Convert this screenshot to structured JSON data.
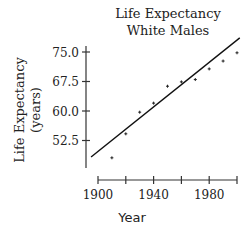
{
  "chart_data": {
    "type": "scatter",
    "title": "Life Expectancy",
    "subtitle": "White Males",
    "xlabel": "Year",
    "ylabel": "Life Expectancy",
    "ylabel_units": "(years)",
    "x_ticks": [
      1900,
      1920,
      1940,
      1960,
      1980,
      2000
    ],
    "x_tick_labels": [
      "1900",
      "",
      "1940",
      "",
      "1980",
      ""
    ],
    "y_ticks": [
      52.5,
      60.0,
      67.5,
      75.0
    ],
    "y_tick_labels": [
      "52.5",
      "60.0",
      "67.5",
      "75.0"
    ],
    "xlim": [
      1900,
      2000
    ],
    "ylim": [
      46,
      78
    ],
    "grid": false,
    "legend": null,
    "series": [
      {
        "name": "Observed",
        "x": [
          1910,
          1920,
          1930,
          1940,
          1950,
          1960,
          1970,
          1980,
          1990,
          2000
        ],
        "y": [
          48.1,
          54.2,
          59.7,
          62.0,
          66.3,
          67.4,
          68.0,
          70.7,
          72.7,
          74.8
        ]
      }
    ],
    "fit_line": {
      "name": "Least-squares regression line",
      "x": [
        1895,
        2002
      ],
      "y": [
        48.3,
        78.6
      ]
    }
  }
}
